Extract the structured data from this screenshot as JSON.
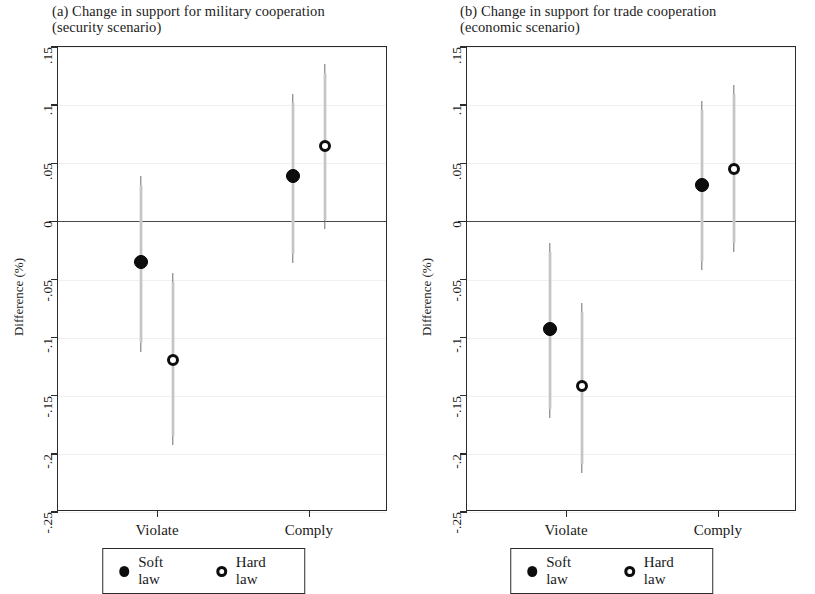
{
  "figure": {
    "y_axis_label": "Difference (%)"
  },
  "legend": {
    "soft_label": "Soft law",
    "hard_label": "Hard law",
    "soft_marker": "filled-circle",
    "hard_marker": "open-circle"
  },
  "panels": [
    {
      "id": "panel-a",
      "title_line1": "(a) Change in support for military cooperation",
      "title_line2": "(security scenario)"
    },
    {
      "id": "panel-b",
      "title_line1": "(b) Change in support for trade cooperation",
      "title_line2": "(economic scenario)"
    }
  ],
  "chart_data": [
    {
      "type": "scatter",
      "title": "(a) Change in support for military cooperation (security scenario)",
      "xlabel": "",
      "ylabel": "Difference (%)",
      "categories": [
        "Violate",
        "Comply"
      ],
      "ylim": [
        -0.25,
        0.15
      ],
      "yticks": [
        ".15",
        ".1",
        ".05",
        "0",
        "-.05",
        "-.1",
        "-.15",
        "-.2",
        "-.25"
      ],
      "ytick_values": [
        0.15,
        0.1,
        0.05,
        0,
        -0.05,
        -0.1,
        -0.15,
        -0.2,
        -0.25
      ],
      "grid": true,
      "zero_reference_line": 0,
      "legend_position": "bottom",
      "series": [
        {
          "name": "Soft law",
          "marker": "filled-circle",
          "values": [
            -0.035,
            0.039
          ],
          "ci_low": [
            -0.105,
            -0.028
          ],
          "ci_high": [
            0.031,
            0.102
          ]
        },
        {
          "name": "Hard law",
          "marker": "open-circle",
          "values": [
            -0.119,
            0.065
          ],
          "ci_low": [
            -0.185,
            0.001
          ],
          "ci_high": [
            -0.052,
            0.128
          ]
        }
      ]
    },
    {
      "type": "scatter",
      "title": "(b) Change in support for trade cooperation (economic scenario)",
      "xlabel": "",
      "ylabel": "Difference (%)",
      "categories": [
        "Violate",
        "Comply"
      ],
      "ylim": [
        -0.25,
        0.15
      ],
      "yticks": [
        ".15",
        ".1",
        ".05",
        "0",
        "-.05",
        "-.1",
        "-.15",
        "-.2",
        "-.25"
      ],
      "ytick_values": [
        0.15,
        0.1,
        0.05,
        0,
        -0.05,
        -0.1,
        -0.15,
        -0.2,
        -0.25
      ],
      "grid": true,
      "zero_reference_line": 0,
      "legend_position": "bottom",
      "series": [
        {
          "name": "Soft law",
          "marker": "filled-circle",
          "values": [
            -0.093,
            0.031
          ],
          "ci_low": [
            -0.161,
            -0.034
          ],
          "ci_high": [
            -0.026,
            0.096
          ]
        },
        {
          "name": "Hard law",
          "marker": "open-circle",
          "values": [
            -0.142,
            0.045
          ],
          "ci_low": [
            -0.209,
            -0.019
          ],
          "ci_high": [
            -0.078,
            0.11
          ]
        }
      ]
    }
  ]
}
